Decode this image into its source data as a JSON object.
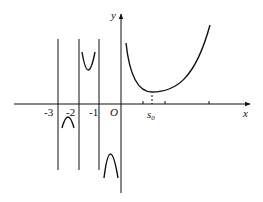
{
  "diagram": {
    "type": "function-graph",
    "axes": {
      "x_label": "x",
      "y_label": "y",
      "origin_label": "O"
    },
    "tick_labels": {
      "neg3": "-3",
      "neg2": "-2",
      "neg1": "-1",
      "s0_main": "s",
      "s0_sub": "0"
    },
    "vertical_asymptotes": [
      "-3",
      "-2",
      "-1"
    ],
    "branches": [
      {
        "interval": "(-3,-2)",
        "shape": "downward arch below x-axis"
      },
      {
        "interval": "(-2,-1)",
        "shape": "U-shape above x-axis"
      },
      {
        "interval": "(-1,0)",
        "shape": "downward arch below x-axis"
      },
      {
        "interval": "(0,+inf)",
        "shape": "U-shape with minimum near s0, above x-axis"
      }
    ]
  }
}
